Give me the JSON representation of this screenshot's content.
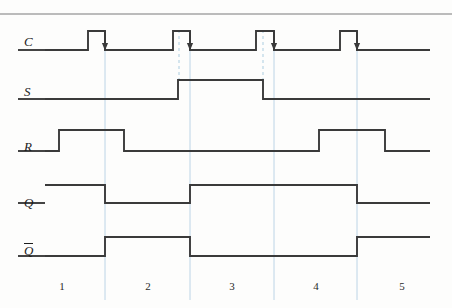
{
  "figure": {
    "type": "digital-timing-diagram",
    "top_rule": {
      "y": 14,
      "color": "#7a7a7a"
    },
    "width": 452,
    "height": 308,
    "stroke_color": "#3a3a3a",
    "guide_color": "#bcd4e6",
    "dashed_color": "#c2dae8"
  },
  "signals": [
    {
      "name": "C",
      "label": "C",
      "overbar": false,
      "label_x": 24,
      "label_y": 35,
      "baseline_y": 50,
      "high_y": 31,
      "initial_level": "low",
      "edge_arrows": true,
      "transitions": [
        88,
        105,
        173,
        190,
        256,
        274,
        340,
        357
      ]
    },
    {
      "name": "S",
      "label": "S",
      "overbar": false,
      "label_x": 24,
      "label_y": 85,
      "baseline_y": 99,
      "high_y": 80,
      "initial_level": "low",
      "edge_arrows": false,
      "transitions": [
        178,
        263
      ]
    },
    {
      "name": "R",
      "label": "R",
      "overbar": false,
      "label_x": 24,
      "label_y": 140,
      "baseline_y": 151,
      "high_y": 130,
      "initial_level": "low",
      "edge_arrows": false,
      "transitions": [
        59,
        124,
        319,
        385
      ]
    },
    {
      "name": "Q",
      "label": "Q",
      "overbar": false,
      "label_x": 24,
      "label_y": 196,
      "baseline_y": 203,
      "high_y": 185,
      "initial_level": "high",
      "edge_arrows": false,
      "transitions": [
        105,
        190,
        357
      ]
    },
    {
      "name": "Qbar",
      "label": "Q",
      "overbar": true,
      "label_x": 24,
      "label_y": 243,
      "baseline_y": 256,
      "high_y": 237,
      "initial_level": "low",
      "edge_arrows": false,
      "transitions": [
        105,
        190,
        357
      ]
    }
  ],
  "guides": {
    "description": "Light vertical guide lines at clock active (falling) edges, extending to the bottom axis",
    "x_positions": [
      105,
      190,
      274,
      357
    ],
    "y_top": 42,
    "y_bottom": 300
  },
  "dashed_guides": {
    "description": "Short dashed vertical markers from clock pulse down to the S waveform transitions",
    "markers": [
      {
        "x": 179,
        "y_top": 30,
        "y_bottom": 82
      },
      {
        "x": 263,
        "y_top": 30,
        "y_bottom": 82
      }
    ]
  },
  "intervals": {
    "labels": [
      "1",
      "2",
      "3",
      "4",
      "5"
    ],
    "centers_x": [
      62,
      148,
      232,
      316,
      402
    ],
    "label_y": 281
  },
  "waveform_data": {
    "type": "timing",
    "time_axis_px": [
      45,
      430
    ],
    "interval_boundaries_px": [
      105,
      190,
      274,
      357
    ],
    "series": [
      {
        "name": "C",
        "levels": [
          "L",
          "H",
          "L",
          "H",
          "L",
          "H",
          "L",
          "H",
          "L"
        ],
        "change_px": [
          88,
          105,
          173,
          190,
          256,
          274,
          340,
          357
        ]
      },
      {
        "name": "S",
        "levels": [
          "L",
          "H",
          "L"
        ],
        "change_px": [
          178,
          263
        ]
      },
      {
        "name": "R",
        "levels": [
          "L",
          "H",
          "L",
          "H",
          "L"
        ],
        "change_px": [
          59,
          124,
          319,
          385
        ]
      },
      {
        "name": "Q",
        "levels": [
          "H",
          "L",
          "H",
          "L"
        ],
        "change_px": [
          105,
          190,
          357
        ]
      },
      {
        "name": "Qbar",
        "levels": [
          "L",
          "H",
          "L",
          "H"
        ],
        "change_px": [
          105,
          190,
          357
        ]
      }
    ]
  }
}
